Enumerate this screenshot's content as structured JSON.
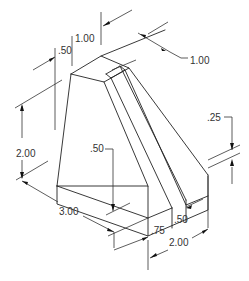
{
  "drawing": {
    "type": "isometric technical drawing",
    "units": "inches",
    "dimensions": {
      "top_step": ".50",
      "top_width": "1.00",
      "right_top_depth": "1.00",
      "height": "2.00",
      "base_thickness_left": ".50",
      "length": "3.00",
      "front_offset": ".75",
      "slot_width": ".50",
      "depth": "2.00",
      "right_step": ".25"
    }
  }
}
